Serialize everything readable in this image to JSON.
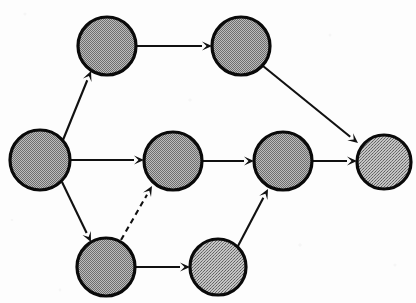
{
  "diagram": {
    "type": "directed-graph",
    "background_color": "#fdfdfd",
    "node_fill_color": "#9a9a9a",
    "node_stroke_color": "#0a0a0a",
    "edge_color": "#111111",
    "canvas": {
      "width": 416,
      "height": 303
    },
    "nodes": [
      {
        "id": "n-left",
        "name": "left-node",
        "cx": 40,
        "cy": 160,
        "r": 30,
        "fill_pattern": "checker-dither"
      },
      {
        "id": "n-top-left",
        "name": "top-left-node",
        "cx": 107,
        "cy": 46,
        "r": 29,
        "fill_pattern": "checker-dither"
      },
      {
        "id": "n-top-right",
        "name": "top-right-node",
        "cx": 241,
        "cy": 46,
        "r": 29,
        "fill_pattern": "checker-dither"
      },
      {
        "id": "n-middle",
        "name": "middle-node",
        "cx": 173,
        "cy": 161,
        "r": 29,
        "fill_pattern": "checker-dither"
      },
      {
        "id": "n-middle-right",
        "name": "middle-right-node",
        "cx": 283,
        "cy": 161,
        "r": 29,
        "fill_pattern": "checker-dither"
      },
      {
        "id": "n-far-right",
        "name": "far-right-node",
        "cx": 384,
        "cy": 162,
        "r": 27,
        "fill_pattern": "cross-dither"
      },
      {
        "id": "n-bottom-left",
        "name": "bottom-left-node",
        "cx": 106,
        "cy": 267,
        "r": 29,
        "fill_pattern": "checker-dither"
      },
      {
        "id": "n-bottom-right",
        "name": "bottom-right-node",
        "cx": 218,
        "cy": 267,
        "r": 28,
        "fill_pattern": "cross-dither"
      }
    ],
    "edges": [
      {
        "id": "e1",
        "name": "edge-left-to-top-left",
        "from": "n-left",
        "to": "n-top-left",
        "style": "solid",
        "direction": "up-right"
      },
      {
        "id": "e2",
        "name": "edge-left-to-middle",
        "from": "n-left",
        "to": "n-middle",
        "style": "solid",
        "direction": "right"
      },
      {
        "id": "e3",
        "name": "edge-left-to-bottom-left",
        "from": "n-left",
        "to": "n-bottom-left",
        "style": "solid",
        "direction": "down-right"
      },
      {
        "id": "e4",
        "name": "edge-top-left-to-top-right",
        "from": "n-top-left",
        "to": "n-top-right",
        "style": "solid",
        "direction": "right"
      },
      {
        "id": "e5",
        "name": "edge-top-right-to-far-right",
        "from": "n-top-right",
        "to": "n-far-right",
        "style": "solid",
        "direction": "down-right"
      },
      {
        "id": "e6",
        "name": "edge-middle-to-middle-right",
        "from": "n-middle",
        "to": "n-middle-right",
        "style": "solid",
        "direction": "right"
      },
      {
        "id": "e7",
        "name": "edge-middle-right-to-far-right",
        "from": "n-middle-right",
        "to": "n-far-right",
        "style": "solid",
        "direction": "right"
      },
      {
        "id": "e8",
        "name": "edge-bottom-left-to-bottom-right",
        "from": "n-bottom-left",
        "to": "n-bottom-right",
        "style": "solid",
        "direction": "right"
      },
      {
        "id": "e9",
        "name": "edge-bottom-right-to-middle-right",
        "from": "n-bottom-right",
        "to": "n-middle-right",
        "style": "solid",
        "direction": "up-right"
      },
      {
        "id": "e10",
        "name": "edge-bottom-left-to-middle",
        "from": "n-bottom-left",
        "to": "n-middle",
        "style": "dashed",
        "direction": "up-right"
      }
    ],
    "edge_geometry": {
      "e1": {
        "x1": 63,
        "y1": 140,
        "x2": 91,
        "y2": 71
      },
      "e2": {
        "x1": 70,
        "y1": 160,
        "x2": 144,
        "y2": 160
      },
      "e3": {
        "x1": 62,
        "y1": 182,
        "x2": 91,
        "y2": 242
      },
      "e4": {
        "x1": 136,
        "y1": 46,
        "x2": 212,
        "y2": 46
      },
      "e5": {
        "x1": 263,
        "y1": 66,
        "x2": 358,
        "y2": 143
      },
      "e6": {
        "x1": 202,
        "y1": 161,
        "x2": 254,
        "y2": 161
      },
      "e7": {
        "x1": 312,
        "y1": 161,
        "x2": 357,
        "y2": 161
      },
      "e8": {
        "x1": 135,
        "y1": 267,
        "x2": 190,
        "y2": 267
      },
      "e9": {
        "x1": 238,
        "y1": 246,
        "x2": 268,
        "y2": 189
      },
      "e10": {
        "x1": 121,
        "y1": 240,
        "x2": 152,
        "y2": 186
      }
    }
  }
}
